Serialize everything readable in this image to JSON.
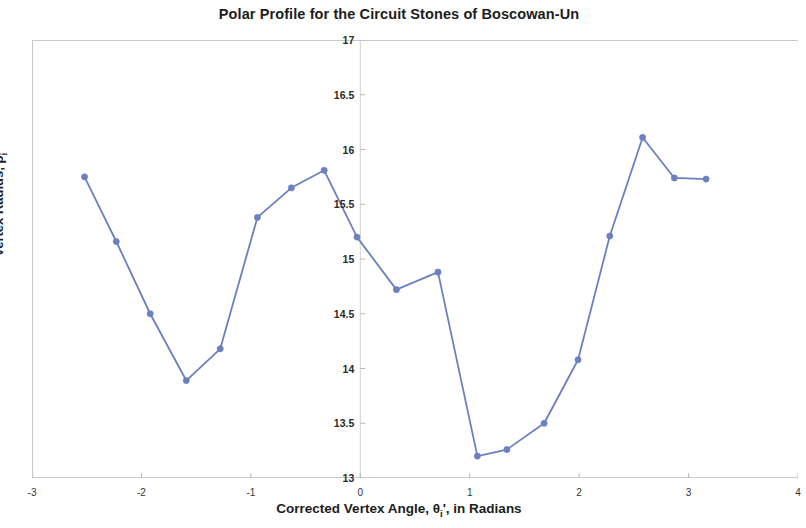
{
  "chart_data": {
    "type": "line",
    "title": "Polar Profile for the Circuit Stones of Boscowan-Un",
    "xlabel": "Corrected Vertex Angle, θi', in Radians",
    "xlabel_parts": {
      "before": "Corrected Vertex Angle, θ",
      "sub": "i",
      "after": "', in Radians"
    },
    "ylabel": "Vertex Radius, ρi",
    "ylabel_parts": {
      "before": "Vertex Radius, ρ",
      "sub": "i"
    },
    "xlim": [
      -3,
      4
    ],
    "ylim": [
      13,
      17
    ],
    "xticks": [
      -3,
      -2,
      -1,
      0,
      1,
      2,
      3,
      4
    ],
    "xtick_labels": [
      "-3",
      "-2",
      "-1",
      "0",
      "1",
      "2",
      "3",
      "4"
    ],
    "yticks": [
      13,
      13.5,
      14,
      14.5,
      15,
      15.5,
      16,
      16.5,
      17
    ],
    "ytick_labels": [
      "13",
      "13.5",
      "14",
      "14.5",
      "15",
      "15.5",
      "16",
      "16.5",
      "17"
    ],
    "grid": false,
    "legend": false,
    "series_color": "#6a80c0",
    "marker_color": "#6a80c0",
    "x": [
      -2.52,
      -2.23,
      -1.92,
      -1.59,
      -1.28,
      -0.94,
      -0.63,
      -0.33,
      -0.03,
      0.33,
      0.71,
      1.07,
      1.34,
      1.68,
      1.99,
      2.28,
      2.58,
      2.87,
      3.16
    ],
    "y": [
      15.75,
      15.16,
      14.5,
      13.89,
      14.18,
      15.38,
      15.65,
      15.81,
      15.2,
      14.72,
      14.88,
      13.2,
      13.26,
      13.5,
      14.08,
      15.21,
      16.11,
      15.74,
      15.73
    ],
    "series": [
      {
        "name": "Vertex Radius",
        "x": [
          -2.52,
          -2.23,
          -1.92,
          -1.59,
          -1.28,
          -0.94,
          -0.63,
          -0.33,
          -0.03,
          0.33,
          0.71,
          1.07,
          1.34,
          1.68,
          1.99,
          2.28,
          2.58,
          2.87,
          3.16
        ],
        "values": [
          15.75,
          15.16,
          14.5,
          13.89,
          14.18,
          15.38,
          15.65,
          15.81,
          15.2,
          14.72,
          14.88,
          13.2,
          13.26,
          13.5,
          14.08,
          15.21,
          16.11,
          15.74,
          15.73
        ]
      }
    ]
  },
  "axis_style": {
    "frame_color": "#c9c9c9",
    "tick_color": "#b8b8b8",
    "ytick_label_x_value": 0
  }
}
